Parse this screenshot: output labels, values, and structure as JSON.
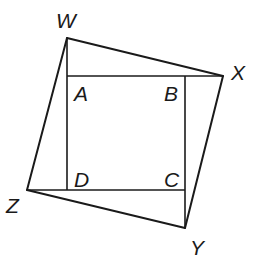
{
  "diagram": {
    "colors": {
      "stroke": "#1a1a1a",
      "background": "#ffffff"
    },
    "points": {
      "W": {
        "label": "W",
        "x": 67,
        "y": 38
      },
      "X": {
        "label": "X",
        "x": 223,
        "y": 76
      },
      "Y": {
        "label": "Y",
        "x": 185,
        "y": 228
      },
      "Z": {
        "label": "Z",
        "x": 27,
        "y": 190
      },
      "A": {
        "label": "A",
        "x": 67,
        "y": 76
      },
      "B": {
        "label": "B",
        "x": 185,
        "y": 76
      },
      "C": {
        "label": "C",
        "x": 185,
        "y": 190
      },
      "D": {
        "label": "D",
        "x": 67,
        "y": 190
      }
    },
    "labels": {
      "W": "W",
      "X": "X",
      "Y": "Y",
      "Z": "Z",
      "A": "A",
      "B": "B",
      "C": "C",
      "D": "D"
    },
    "segments": [
      [
        "W",
        "X"
      ],
      [
        "X",
        "Y"
      ],
      [
        "Y",
        "Z"
      ],
      [
        "Z",
        "W"
      ],
      [
        "A",
        "B"
      ],
      [
        "B",
        "C"
      ],
      [
        "C",
        "D"
      ],
      [
        "D",
        "A"
      ],
      [
        "W",
        "A"
      ],
      [
        "B",
        "X"
      ],
      [
        "C",
        "Y"
      ],
      [
        "D",
        "Z"
      ]
    ]
  }
}
